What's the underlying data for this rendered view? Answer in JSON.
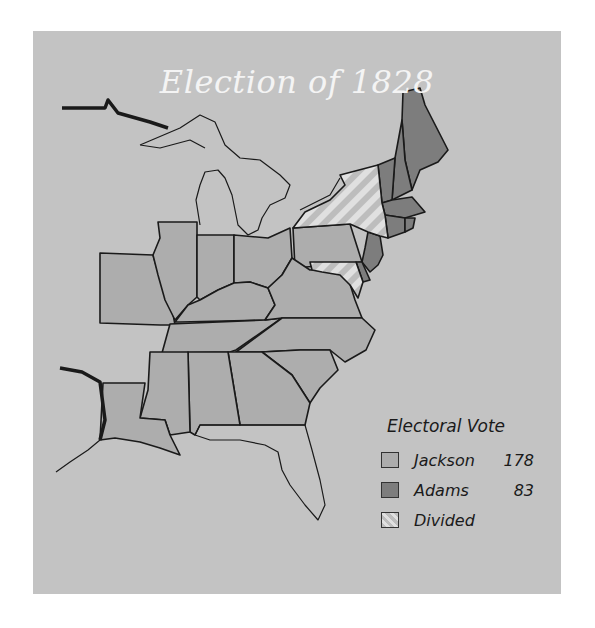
{
  "map": {
    "title": "Election of 1828",
    "colors": {
      "background": "#c3c3c3",
      "jackson": "#adadad",
      "adams": "#7d7d7d",
      "divided_stripe_light": "#e0e0e0",
      "divided_stripe_dark": "#bdbdbd",
      "title_text": "#f4f4f4",
      "borders": "#1a1a1a"
    },
    "states": {
      "jackson": [
        "Missouri",
        "Illinois",
        "Indiana",
        "Ohio",
        "Kentucky",
        "Tennessee",
        "Pennsylvania",
        "Virginia",
        "North Carolina",
        "South Carolina",
        "Georgia",
        "Alabama",
        "Mississippi",
        "Louisiana"
      ],
      "adams": [
        "Maine",
        "New Hampshire",
        "Vermont",
        "Massachusetts",
        "Rhode Island",
        "Connecticut",
        "New Jersey",
        "Delaware"
      ],
      "divided": [
        "New York",
        "Maryland"
      ]
    }
  },
  "legend": {
    "title": "Electoral Vote",
    "items": [
      {
        "label": "Jackson",
        "value": "178",
        "swatch": "jackson"
      },
      {
        "label": "Adams",
        "value": "83",
        "swatch": "adams"
      },
      {
        "label": "Divided",
        "value": "",
        "swatch": "divided"
      }
    ]
  }
}
